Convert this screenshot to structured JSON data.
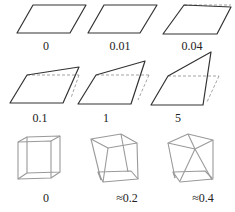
{
  "figure": {
    "row1": {
      "labels": [
        "0",
        "0.01",
        "0.04"
      ]
    },
    "row2": {
      "labels": [
        "0.1",
        "1",
        "5"
      ]
    },
    "row3": {
      "labels": [
        "0",
        "≈0.2",
        "≈0.4"
      ]
    },
    "colors": {
      "outline": "#333333",
      "dashed_reference": "#999999",
      "cube_wireframe": "#9a9a9a"
    }
  }
}
